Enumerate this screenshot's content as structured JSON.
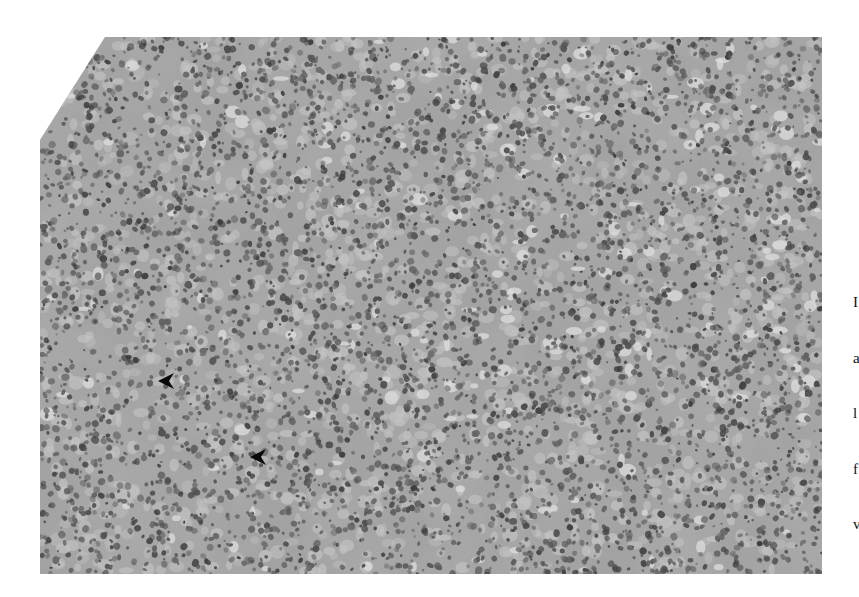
{
  "figure": {
    "type": "histology-micrograph",
    "stain": "grayscale",
    "bounds": {
      "left": 40,
      "top": 37,
      "right": 822,
      "bottom": 574
    },
    "outline_points": [
      [
        105,
        37
      ],
      [
        822,
        37
      ],
      [
        822,
        574
      ],
      [
        40,
        574
      ],
      [
        40,
        140
      ]
    ],
    "palette": {
      "background": "#ffffff",
      "tissue_base": "#a6a6a6",
      "tissue_light": "#cfcfcf",
      "nucleus_dark": "#3a3a3a",
      "vacuole": "#efefef",
      "arrow": "#0a0a0a"
    }
  },
  "annotations": {
    "arrows": [
      {
        "id": "arrow-1",
        "tip_x": 158,
        "tip_y": 381,
        "direction": "left",
        "label": ""
      },
      {
        "id": "arrow-2",
        "tip_x": 250,
        "tip_y": 457,
        "direction": "left",
        "label": ""
      }
    ]
  },
  "edge_text": {
    "note": "Partially visible caption text cropped at right edge",
    "lines": [
      "I",
      "a",
      "l",
      "f",
      "v"
    ]
  }
}
